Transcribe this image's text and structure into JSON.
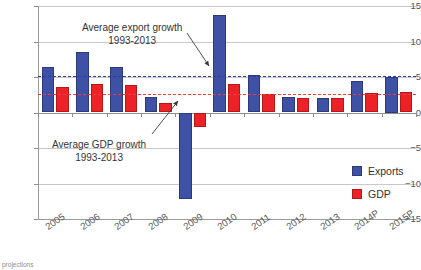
{
  "chart_data": {
    "type": "bar",
    "title": "",
    "xlabel": "",
    "ylabel": "",
    "ylim": [
      -15,
      15
    ],
    "yticks": [
      15,
      10,
      5,
      0,
      -5,
      -10,
      -15
    ],
    "grid": true,
    "legend_position": "right-inside",
    "categories": [
      "2005",
      "2006",
      "2007",
      "2008",
      "2009",
      "2010",
      "2011",
      "2012",
      "2013",
      "2014P",
      "2015P"
    ],
    "series": [
      {
        "name": "Exports",
        "color": "#3f51a5",
        "values": [
          6.4,
          8.5,
          6.4,
          2.2,
          -12.2,
          13.8,
          5.3,
          2.2,
          2.1,
          4.5,
          5.0
        ]
      },
      {
        "name": "GDP",
        "color": "#ec2227",
        "values": [
          3.6,
          4.0,
          3.9,
          1.4,
          -2.1,
          4.0,
          2.6,
          2.1,
          2.0,
          2.8,
          2.9
        ]
      }
    ],
    "reference_lines": [
      {
        "name": "Average export growth 1993-2013",
        "value": 5.2,
        "color": "#2b3f9e",
        "style": "dashed"
      },
      {
        "name": "Average GDP growth 1993-2013",
        "value": 2.6,
        "color": "#ee3b3b",
        "style": "dashed"
      }
    ],
    "annotations": [
      {
        "line1": "Average export growth",
        "line2": "1993-2013"
      },
      {
        "line1": "Average GDP growth",
        "line2": "1993-2013"
      }
    ]
  },
  "legend": {
    "items": [
      {
        "label": "Exports"
      },
      {
        "label": "GDP"
      }
    ]
  },
  "footnote": {
    "text": "projections"
  }
}
